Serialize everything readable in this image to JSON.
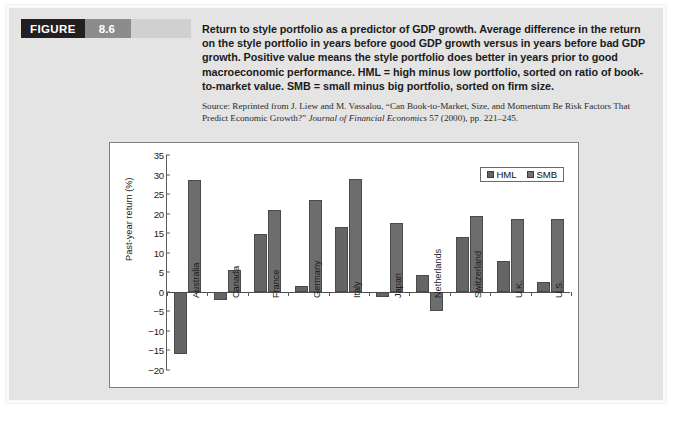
{
  "figure": {
    "label": "FIGURE",
    "number": "8.6",
    "caption": "Return to style portfolio as a predictor of GDP growth. Average difference in the return on the style portfolio in years before good GDP growth versus in years before bad GDP growth. Positive value means the style portfolio does better in years prior to good macroeconomic performance. HML = high minus low portfolio, sorted on ratio of book-to-market value. SMB = small minus big portfolio, sorted on firm size.",
    "source_prefix": "Source: Reprinted from J. Liew and M. Vassalou, “Can Book-to-Market, Size, and Momentum Be Risk Factors That Predict Economic Growth?” ",
    "source_journal": "Journal of Financial Economics",
    "source_suffix": " 57 (2000), pp. 221–245."
  },
  "colors": {
    "hml_bar": "#656565",
    "smb_bar": "#6d6d6d",
    "panel_background": "#e4e4e4",
    "figure_label_block": "#231f20",
    "figure_number_block": "#8c8c8c",
    "axis": "#5a5a5a"
  },
  "chart_data": {
    "type": "bar",
    "title": "",
    "xlabel": "",
    "ylabel": "Past-year return (%)",
    "ylim": [
      -20,
      35
    ],
    "yticks": [
      35,
      30,
      25,
      20,
      15,
      10,
      5,
      0,
      -5,
      -10,
      -15,
      -20
    ],
    "ytick_labels": [
      "35",
      "30",
      "25",
      "20",
      "15",
      "10",
      "5",
      "0",
      "−5",
      "−10",
      "−15",
      "−20"
    ],
    "grid": false,
    "legend_position": "top-right",
    "categories": [
      "Australia",
      "Canada",
      "France",
      "Germany",
      "Italy",
      "Japan",
      "Netherlands",
      "Switzerland",
      "U.K.",
      "U.S."
    ],
    "series": [
      {
        "name": "HML",
        "values": [
          -15.8,
          -2.2,
          14.8,
          1.4,
          16.6,
          -1.2,
          4.3,
          14.1,
          7.8,
          2.4
        ]
      },
      {
        "name": "SMB",
        "values": [
          28.7,
          5.5,
          20.9,
          23.4,
          28.9,
          17.6,
          -4.8,
          19.4,
          18.6,
          18.7
        ]
      }
    ]
  }
}
